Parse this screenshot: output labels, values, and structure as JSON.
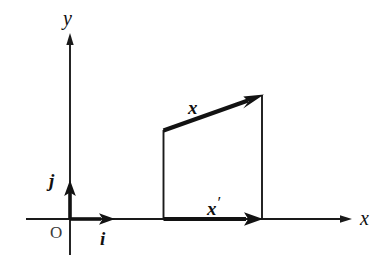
{
  "figure": {
    "background_color": "#ffffff",
    "ink_color": "#121212",
    "width": 383,
    "height": 267
  },
  "axes": {
    "x_axis": {
      "label": "x",
      "icon": "axis-arrow-right-icon",
      "y_pixel": 219,
      "start_x": 26,
      "end_x": 350
    },
    "y_axis": {
      "label": "y",
      "icon": "axis-arrow-up-icon",
      "x_pixel": 70,
      "start_y": 255,
      "end_y": 33
    },
    "origin": {
      "label": "O",
      "x_pixel": 70,
      "y_pixel": 219
    }
  },
  "unit_vectors": [
    {
      "name": "i",
      "label": "i",
      "description": "unit basis vector along x-axis",
      "from": [
        70,
        219
      ],
      "to": [
        113,
        219
      ]
    },
    {
      "name": "j",
      "label": "j",
      "description": "unit basis vector along y-axis",
      "from": [
        70,
        219
      ],
      "to": [
        70,
        182
      ]
    }
  ],
  "vectors": [
    {
      "name": "x",
      "label": "x",
      "prime": "",
      "description": "vector x drawn from the top-left vertex to the top-right vertex",
      "from": [
        163,
        130
      ],
      "to": [
        262,
        95
      ]
    },
    {
      "name": "x-prime",
      "label": "x",
      "prime": "′",
      "description": "projection vector x-prime drawn along the x-axis",
      "from": [
        163,
        219
      ],
      "to": [
        262,
        219
      ]
    }
  ],
  "quadrilateral": {
    "description": "thin quadrilateral outline connecting the vector endpoints to the x-axis",
    "vertices": [
      [
        163,
        130
      ],
      [
        262,
        95
      ],
      [
        262,
        218
      ],
      [
        163,
        219
      ]
    ],
    "drawn_edges": [
      "left vertical from (163,130) to (163,219)",
      "right vertical from (262,95) to (262,218)"
    ]
  }
}
